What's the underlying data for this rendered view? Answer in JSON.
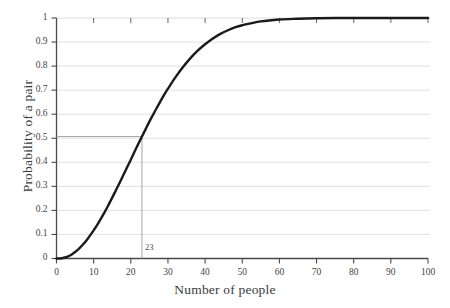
{
  "chart_data": {
    "type": "line",
    "title": "",
    "xlabel": "Number of people",
    "ylabel": "Probability of a pair",
    "xlim": [
      0,
      100
    ],
    "ylim": [
      0,
      1
    ],
    "grid": true,
    "grid_axis": "y",
    "legend": "none",
    "xticks": [
      0,
      10,
      20,
      30,
      40,
      50,
      60,
      70,
      80,
      90,
      100
    ],
    "xtick_labels": [
      "0",
      "10",
      "20",
      "30",
      "40",
      "50",
      "60",
      "70",
      "80",
      "90",
      "100"
    ],
    "yticks": [
      0,
      0.1,
      0.2,
      0.3,
      0.4,
      0.5,
      0.6,
      0.7,
      0.8,
      0.9,
      1
    ],
    "ytick_labels": [
      "0",
      "0.1",
      "0.2",
      "0.3",
      "0.4",
      "0.5",
      "0.6",
      "0.7",
      "0.8",
      "0.9",
      "1"
    ],
    "series": [
      {
        "name": "Probability of a shared birthday",
        "color": "#1a1a1a",
        "x": [
          0,
          1,
          2,
          3,
          4,
          5,
          6,
          7,
          8,
          9,
          10,
          11,
          12,
          13,
          14,
          15,
          16,
          17,
          18,
          19,
          20,
          21,
          22,
          23,
          24,
          25,
          26,
          27,
          28,
          29,
          30,
          32,
          34,
          36,
          38,
          40,
          42,
          44,
          46,
          48,
          50,
          55,
          60,
          65,
          70,
          75,
          80,
          85,
          90,
          95,
          100
        ],
        "y": [
          0,
          0,
          0.003,
          0.008,
          0.016,
          0.027,
          0.04,
          0.056,
          0.074,
          0.095,
          0.117,
          0.141,
          0.167,
          0.194,
          0.223,
          0.253,
          0.284,
          0.315,
          0.347,
          0.379,
          0.411,
          0.444,
          0.476,
          0.507,
          0.538,
          0.569,
          0.598,
          0.627,
          0.654,
          0.681,
          0.706,
          0.753,
          0.795,
          0.832,
          0.864,
          0.891,
          0.914,
          0.933,
          0.948,
          0.961,
          0.97,
          0.986,
          0.994,
          0.997,
          0.999,
          1,
          1,
          1,
          1,
          1,
          1
        ]
      }
    ],
    "annotations": [
      {
        "name": "half-probability-marker",
        "label": "23",
        "x": 23,
        "y": 0.507,
        "description": "Vertical and horizontal guide lines marking 23 people at probability ~0.507"
      }
    ]
  },
  "figure": {
    "background": "#ffffff",
    "curve_color": "#1a1a1a",
    "axis_color": "#4a4a4a",
    "grid_color": "#d8d8d8",
    "marker_line_color": "#9a9a9a"
  }
}
